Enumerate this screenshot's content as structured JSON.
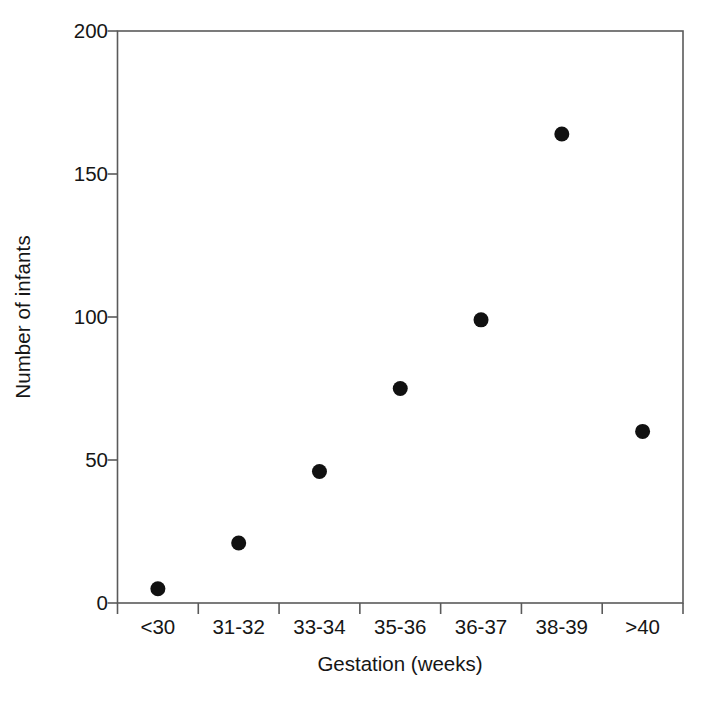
{
  "chart_data": {
    "type": "scatter",
    "title": "",
    "xlabel": "Gestation (weeks)",
    "ylabel": "Number of infants",
    "categories": [
      "<30",
      "31-32",
      "33-34",
      "35-36",
      "36-37",
      "38-39",
      ">40"
    ],
    "values": [
      5,
      21,
      46,
      75,
      99,
      164,
      60
    ],
    "ylim": [
      0,
      200
    ],
    "yticks": [
      0,
      50,
      100,
      150,
      200
    ],
    "ytick_labels": [
      "0",
      "50",
      "100",
      "150",
      "200"
    ],
    "grid": false,
    "legend": null,
    "marker": {
      "shape": "circle",
      "color": "#111111",
      "size": 15
    },
    "axis": {
      "color": "#5a5a5a",
      "frame": "box",
      "tick_direction": "out"
    }
  },
  "figure": {
    "background": "#ffffff",
    "text_color": "#161616"
  }
}
